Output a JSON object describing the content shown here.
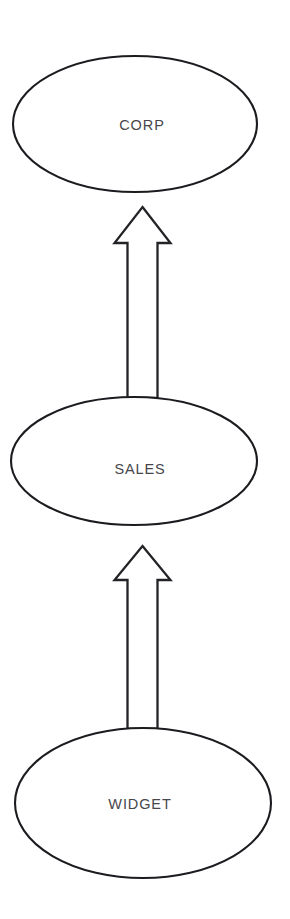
{
  "diagram": {
    "type": "hierarchy-flow",
    "title": "",
    "orientation": "bottom-up",
    "background_color": "#ffffff",
    "node_fill_color": "#ffffff",
    "node_stroke_color": "#1c1c20",
    "label_color": "#47474b",
    "arrow_fill_color": "#ffffff",
    "arrow_stroke_color": "#232327",
    "nodes": [
      {
        "id": "corp",
        "label": "CORP",
        "shape": "ellipse",
        "cx": 135,
        "cy": 124,
        "rx": 122,
        "ry": 68,
        "level": 0
      },
      {
        "id": "sales",
        "label": "SALES",
        "shape": "ellipse",
        "cx": 134,
        "cy": 461,
        "rx": 123,
        "ry": 64,
        "level": 1
      },
      {
        "id": "widget",
        "label": "WIDGET",
        "shape": "ellipse",
        "cx": 143,
        "cy": 803,
        "rx": 128,
        "ry": 75,
        "level": 2
      }
    ],
    "edges": [
      {
        "id": "edge-sales-to-corp",
        "from": "sales",
        "to": "corp",
        "style": "hollow-block-arrow",
        "direction": "up",
        "label": ""
      },
      {
        "id": "edge-widget-to-sales",
        "from": "widget",
        "to": "sales",
        "style": "hollow-block-arrow",
        "direction": "up",
        "label": ""
      }
    ]
  }
}
